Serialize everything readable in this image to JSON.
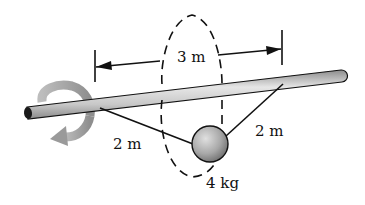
{
  "diagram": {
    "type": "mechanics-figure",
    "labels": {
      "span": "3 m",
      "left_cable": "2 m",
      "right_cable": "2 m",
      "mass": "4 kg"
    },
    "elements": {
      "shaft": "rotating horizontal shaft (cylinder)",
      "rotation_arrow": "curved arrow indicating shaft rotation",
      "dimension": "span between cable attachment points on shaft",
      "cables": "two cables from shaft to ball",
      "ball": "sphere mass",
      "path": "dashed circular path of ball around shaft"
    },
    "colors": {
      "shaft_light": "#e4e4e4",
      "shaft_dark": "#8a8a8a",
      "outline": "#111111",
      "arrow_gray": "#9a9a9a",
      "ball_light": "#d8d8d8",
      "ball_dark": "#7a7a7a"
    }
  }
}
